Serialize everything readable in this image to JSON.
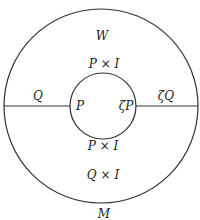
{
  "diagram": {
    "type": "annulus-cobordism",
    "outer_circle": {
      "cx": 101,
      "cy": 106,
      "r": 97,
      "stroke": "#333333"
    },
    "inner_circle": {
      "cx": 103,
      "cy": 106,
      "r": 33,
      "stroke": "#333333"
    },
    "left_segment": {
      "x1": 4,
      "x2": 70,
      "y": 106
    },
    "right_segment": {
      "x1": 136,
      "x2": 198,
      "y": 106
    },
    "labels": {
      "W": "W",
      "P_x_I_top": "P × I",
      "Q": "Q",
      "P": "P",
      "zeta_P": "ζP",
      "zeta_Q": "ζQ",
      "P_x_I_bottom": "P × I",
      "Q_x_I": "Q × I",
      "M": "M"
    }
  }
}
